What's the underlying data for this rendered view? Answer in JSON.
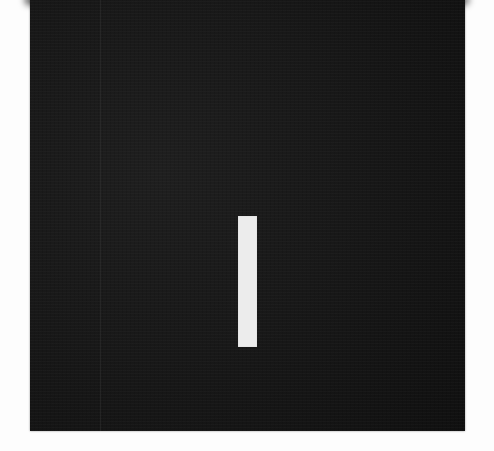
{
  "scene": {
    "background_color": "#fdfdfd",
    "panel": {
      "color": "#161616",
      "left": 30,
      "top": 0,
      "width": 435,
      "height": 431
    },
    "bar": {
      "color": "#ececec",
      "left": 238,
      "top": 216,
      "width": 19,
      "height": 131
    }
  }
}
